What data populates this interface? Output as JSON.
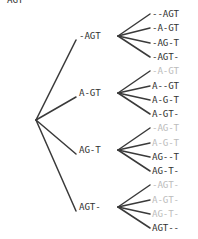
{
  "diagram": {
    "sequence": "AGT",
    "gap_character": "-",
    "colors": {
      "text": "#333333",
      "dimmed_text": "#bcbcbc",
      "edge": "#3a3a3a",
      "background": "#ffffff"
    },
    "root": {
      "label": "AGT",
      "x": 20,
      "y": 120
    },
    "middle_nodes": [
      {
        "label": "-AGT",
        "x": 96,
        "y": 36
      },
      {
        "label": "A-GT",
        "x": 96,
        "y": 93
      },
      {
        "label": "AG-T",
        "x": 96,
        "y": 150
      },
      {
        "label": "AGT-",
        "x": 96,
        "y": 207
      }
    ],
    "leaves": [
      {
        "label": "--AGT",
        "y": 14,
        "dimmed": false,
        "parent": 0
      },
      {
        "label": "-A-GT",
        "y": 28,
        "dimmed": false,
        "parent": 0
      },
      {
        "label": "-AG-T",
        "y": 43,
        "dimmed": false,
        "parent": 0
      },
      {
        "label": "-AGT-",
        "y": 57,
        "dimmed": false,
        "parent": 0
      },
      {
        "label": "-A-GT",
        "y": 71,
        "dimmed": true,
        "parent": 1
      },
      {
        "label": "A--GT",
        "y": 86,
        "dimmed": false,
        "parent": 1
      },
      {
        "label": "A-G-T",
        "y": 100,
        "dimmed": false,
        "parent": 1
      },
      {
        "label": "A-GT-",
        "y": 114,
        "dimmed": false,
        "parent": 1
      },
      {
        "label": "-AG-T",
        "y": 128,
        "dimmed": true,
        "parent": 2
      },
      {
        "label": "A-G-T",
        "y": 143,
        "dimmed": true,
        "parent": 2
      },
      {
        "label": "AG--T",
        "y": 157,
        "dimmed": false,
        "parent": 2
      },
      {
        "label": "AG-T-",
        "y": 171,
        "dimmed": false,
        "parent": 2
      },
      {
        "label": "-AGT-",
        "y": 185,
        "dimmed": true,
        "parent": 3
      },
      {
        "label": "A-GT-",
        "y": 200,
        "dimmed": true,
        "parent": 3
      },
      {
        "label": "AG-T-",
        "y": 214,
        "dimmed": true,
        "parent": 3
      },
      {
        "label": "AGT--",
        "y": 228,
        "dimmed": false,
        "parent": 3
      }
    ],
    "edges": {
      "root_fan_x": 36,
      "mid_start_x": 78,
      "mid_fan_x": 118,
      "leaf_start_x": 150
    }
  }
}
